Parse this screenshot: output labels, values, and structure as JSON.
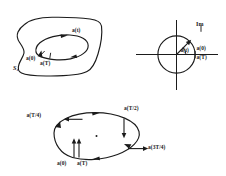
{
  "figure": {
    "background_color": "#ffffff",
    "ink_color": "#1b1b1b",
    "width": 226,
    "height": 176
  },
  "panel_region": {
    "name": "blob-with-inner-loop",
    "region_label": "S₁",
    "curve_label": "a(t)",
    "start_label": "a(0)",
    "end_label": "a(T)"
  },
  "panel_circle": {
    "name": "unit-circle-with-vector",
    "axis_label": "Im",
    "vector_label": "a(t)",
    "start_label": "a(0)",
    "end_label": "a(T)"
  },
  "panel_ellipse": {
    "name": "oriented-ellipse-with-velocity-vectors",
    "quarter_label": "a(T/4)",
    "half_label": "a(T/2)",
    "three_quarter_label": "a(3T/4)",
    "start_label": "a(0)",
    "end_label": "a(T)"
  }
}
